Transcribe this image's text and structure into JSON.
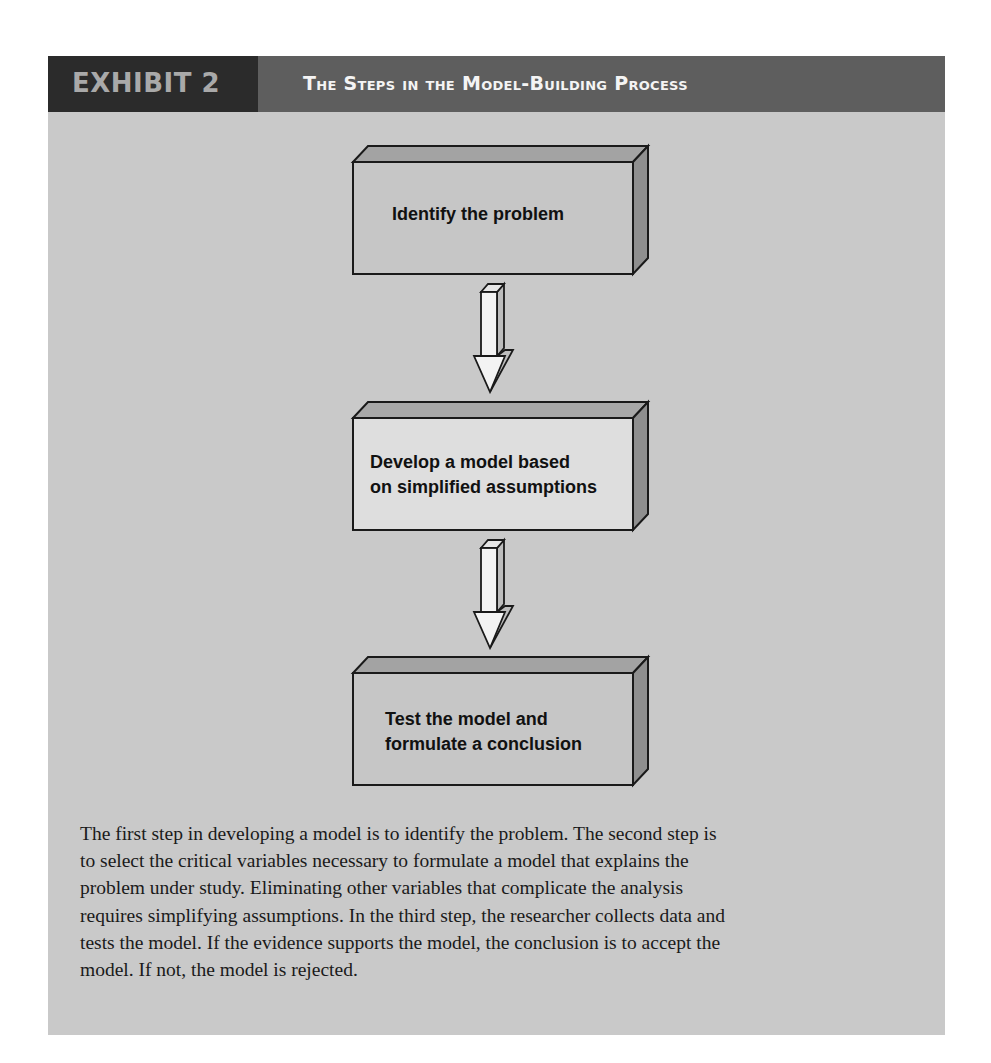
{
  "header": {
    "exhibit_label": "EXHIBIT 2",
    "title": "The Steps in the Model-Building Process"
  },
  "diagram": {
    "steps": [
      {
        "label_lines": [
          "Identify the problem"
        ]
      },
      {
        "label_lines": [
          "Develop a model based",
          "on simplified assumptions"
        ]
      },
      {
        "label_lines": [
          "Test the model and",
          "formulate a conclusion"
        ]
      }
    ],
    "arrows": [
      "down-arrow",
      "down-arrow"
    ]
  },
  "caption": {
    "lines": [
      "The first step in developing a model is to identify the problem. The second step is",
      "to select the critical variables necessary to formulate a model that explains the",
      "problem under study. Eliminating other variables that complicate the analysis",
      "requires simplifying assumptions. In the third step, the researcher collects data and",
      "tests the model. If the evidence supports the model, the conclusion is to accept the",
      "model. If not, the model is rejected."
    ]
  },
  "colors": {
    "header_dark": "#2b2b2b",
    "header_mid": "#5e5e5e",
    "panel_bg": "#c9c9c9",
    "box_face_default": "#c6c6c6",
    "box_face_highlight": "#dedede",
    "box_bevel": "#9a9a9a",
    "arrow_fill": "#f3f3f3"
  }
}
